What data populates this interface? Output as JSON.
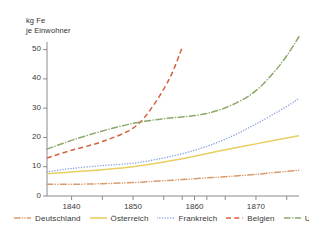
{
  "chart_data": {
    "type": "line",
    "title": "",
    "subtitle": "",
    "ylabel": "kg Fe\nje Einwohner",
    "xlabel": "",
    "ylim": [
      0,
      57
    ],
    "xlim": [
      1836,
      1877
    ],
    "grid": false,
    "legend_position": "bottom",
    "yticks": [
      0,
      10,
      20,
      30,
      40,
      50
    ],
    "ytick_labels": [
      "0",
      "10",
      "20",
      "30",
      "40",
      "50"
    ],
    "xticks": [
      1840,
      1845,
      1850,
      1855,
      1858,
      1860,
      1862,
      1865,
      1870,
      1875
    ],
    "xtick_labels": [
      "1840",
      "1850",
      "1860",
      "1870"
    ],
    "xtick_label_values": [
      1840,
      1850,
      1860,
      1870
    ],
    "series": [
      {
        "name": "Deutschland",
        "color": "#d99a6c",
        "style": "dash-dot-dot",
        "x": [
          1836,
          1840,
          1845,
          1850,
          1855,
          1860,
          1865,
          1870,
          1875,
          1877
        ],
        "values": [
          4.0,
          4.0,
          4.2,
          4.6,
          5.2,
          5.9,
          6.6,
          7.4,
          8.4,
          8.8
        ]
      },
      {
        "name": "Österreich",
        "color": "#e8cf62",
        "style": "solid",
        "x": [
          1836,
          1840,
          1845,
          1850,
          1855,
          1860,
          1865,
          1870,
          1875,
          1877
        ],
        "values": [
          7.6,
          8.2,
          9.0,
          10.0,
          11.6,
          13.6,
          15.8,
          17.8,
          19.8,
          20.6
        ]
      },
      {
        "name": "Frankreich",
        "color": "#8fa8dd",
        "style": "dotted",
        "x": [
          1836,
          1840,
          1845,
          1850,
          1855,
          1860,
          1865,
          1870,
          1875,
          1877
        ],
        "values": [
          8.2,
          9.4,
          10.4,
          11.2,
          13.0,
          15.6,
          19.4,
          24.6,
          30.6,
          33.4
        ]
      },
      {
        "name": "Belgien",
        "color": "#d4603c",
        "style": "dashed",
        "x": [
          1836,
          1840,
          1845,
          1850,
          1853,
          1856,
          1858
        ],
        "values": [
          13.0,
          15.6,
          18.6,
          23.2,
          30.0,
          40.4,
          50.8
        ]
      },
      {
        "name": "USA",
        "color": "#8ca86a",
        "style": "dash-dot",
        "x": [
          1836,
          1840,
          1845,
          1850,
          1855,
          1858,
          1862,
          1866,
          1870,
          1874,
          1877
        ],
        "values": [
          16.0,
          19.0,
          22.2,
          24.8,
          26.4,
          27.0,
          28.2,
          31.0,
          36.0,
          45.0,
          54.4
        ]
      }
    ]
  },
  "legend": {
    "items": [
      {
        "label": "Deutschland",
        "color": "#d99a6c",
        "style": "dash-dot-dot"
      },
      {
        "label": "Österreich",
        "color": "#e8cf62",
        "style": "solid"
      },
      {
        "label": "Frankreich",
        "color": "#8fa8dd",
        "style": "dotted"
      },
      {
        "label": "Belgien",
        "color": "#d4603c",
        "style": "dashed"
      },
      {
        "label": "USA",
        "color": "#8ca86a",
        "style": "dash-dot"
      }
    ]
  },
  "axes": {
    "y_title": "kg Fe\nje Einwohner",
    "axis_color": "#8a8a8a"
  }
}
